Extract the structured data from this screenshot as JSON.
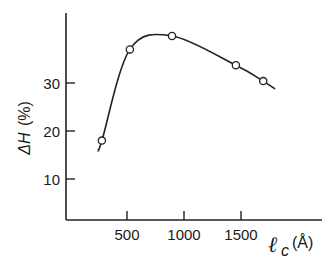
{
  "chart_data": {
    "type": "line",
    "title": "",
    "xlabel": "ℓc (Å)",
    "xlabel_parts": {
      "symbol": "ℓ",
      "subscript": "c",
      "unit": "(Å)"
    },
    "ylabel": "ΔH (%)",
    "ylabel_parts": {
      "symbol": "ΔH",
      "unit": "(%)"
    },
    "x_ticks": [
      500,
      1000,
      1500
    ],
    "y_ticks": [
      10,
      20,
      30
    ],
    "xlim": [
      0,
      2200
    ],
    "ylim": [
      1.5,
      44
    ],
    "grid": false,
    "legend": null,
    "series": [
      {
        "name": "measured",
        "marker": "open-circle",
        "points": [
          {
            "x": 280,
            "y": 18
          },
          {
            "x": 525,
            "y": 37
          },
          {
            "x": 895,
            "y": 39.8
          },
          {
            "x": 1455,
            "y": 33.7
          },
          {
            "x": 1695,
            "y": 30.4
          }
        ]
      }
    ],
    "fit_curve": {
      "description": "smooth hand-drawn curve through the points",
      "x_range": [
        250,
        1800
      ]
    }
  }
}
